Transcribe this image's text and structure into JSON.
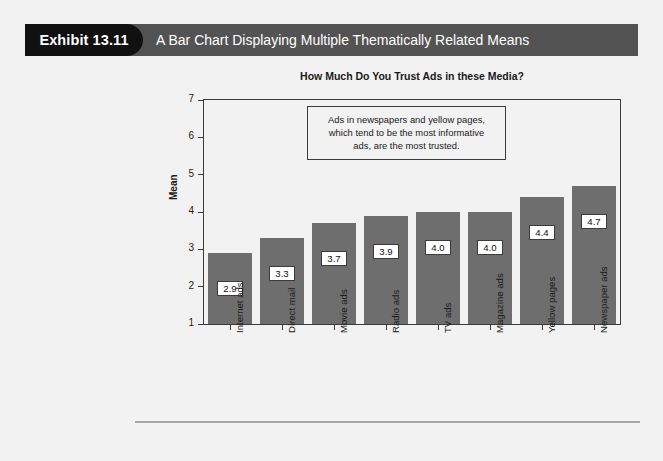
{
  "exhibit": {
    "number_label": "Exhibit 13.11",
    "caption": "A Bar Chart Displaying Multiple Thematically Related Means"
  },
  "colors": {
    "tab_background": "#111111",
    "header_background": "#535353",
    "header_text": "#ffffff",
    "bar_fill": "#6e6e6e",
    "plot_background": "#f2f2f2",
    "axis_line": "#3b3b3b",
    "page_background": "#f2f2f2",
    "rule": "#a8a8a8"
  },
  "chart_data": {
    "type": "bar",
    "title": "How Much Do You Trust Ads in these Media?",
    "xlabel": "",
    "ylabel": "Mean",
    "ylim": [
      1,
      7
    ],
    "yticks": [
      1,
      2,
      3,
      4,
      5,
      6,
      7
    ],
    "ytick_labels": [
      "1",
      "2",
      "3",
      "4",
      "5",
      "6",
      "7"
    ],
    "grid": false,
    "legend": false,
    "categories": [
      "Internet ads",
      "Direct mail",
      "Movie ads",
      "Radio ads",
      "TV ads",
      "Magazine ads",
      "Yellow pages",
      "Newspaper ads"
    ],
    "values": [
      2.9,
      3.3,
      3.7,
      3.9,
      4.0,
      4.0,
      4.4,
      4.7
    ],
    "value_labels": [
      "2.9",
      "3.3",
      "3.7",
      "3.9",
      "4.0",
      "4.0",
      "4.4",
      "4.7"
    ],
    "annotations": [
      {
        "text": "Ads in newspapers and yellow pages, which tend to be the most informative ads, are the most trusted.",
        "lines": [
          "Ads in newspapers and yellow pages,",
          "which tend to be the most informative",
          "ads, are the most trusted."
        ]
      }
    ]
  }
}
